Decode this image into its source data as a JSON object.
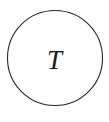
{
  "figure": {
    "type": "node-diagram",
    "width": 109,
    "height": 122,
    "background_color": "#ffffff"
  },
  "node": {
    "shape": "circle",
    "label": "T",
    "label_style": "italic-serif",
    "stroke_color": "#262626",
    "stroke_width": 1.1,
    "fill_color": "#ffffff",
    "center_x": 55,
    "center_y": 58,
    "radius": 48
  }
}
